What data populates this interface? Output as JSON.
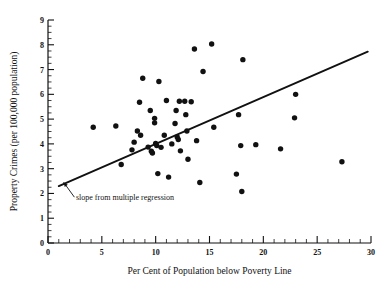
{
  "chart_data": {
    "type": "scatter",
    "title": "",
    "xlabel": "Per Cent of Population below Poverty Line",
    "ylabel": "Property Crimes (per 100,000 population)",
    "xlim": [
      0,
      30
    ],
    "ylim": [
      0,
      9
    ],
    "xticks": [
      0,
      5,
      10,
      15,
      20,
      25,
      30
    ],
    "yticks": [
      0,
      1,
      2,
      3,
      4,
      5,
      6,
      7,
      8,
      9
    ],
    "xtick_labels": [
      "0",
      "5",
      "10",
      "15",
      "20",
      "25",
      "30"
    ],
    "ytick_labels": [
      "0",
      "1",
      "2",
      "3",
      "4",
      "5",
      "6",
      "7",
      "8",
      "9"
    ],
    "x_minor_tick_step": 1,
    "y_minor_tick_step": 0.25,
    "grid": false,
    "legend": null,
    "point_color": "#111111",
    "line_color": "#111111",
    "background_color": "#ffffff",
    "points": [
      {
        "x": 4.2,
        "y": 4.67
      },
      {
        "x": 6.3,
        "y": 4.72
      },
      {
        "x": 6.8,
        "y": 3.17
      },
      {
        "x": 7.8,
        "y": 3.76
      },
      {
        "x": 8.0,
        "y": 4.07
      },
      {
        "x": 8.3,
        "y": 4.52
      },
      {
        "x": 8.5,
        "y": 5.68
      },
      {
        "x": 8.6,
        "y": 4.35
      },
      {
        "x": 8.8,
        "y": 6.65
      },
      {
        "x": 9.3,
        "y": 3.87
      },
      {
        "x": 9.5,
        "y": 5.35
      },
      {
        "x": 9.6,
        "y": 3.7
      },
      {
        "x": 9.7,
        "y": 3.63
      },
      {
        "x": 9.9,
        "y": 4.85
      },
      {
        "x": 9.9,
        "y": 5.03
      },
      {
        "x": 10.0,
        "y": 4.02
      },
      {
        "x": 10.1,
        "y": 3.93
      },
      {
        "x": 10.2,
        "y": 2.8
      },
      {
        "x": 10.3,
        "y": 6.52
      },
      {
        "x": 10.5,
        "y": 3.86
      },
      {
        "x": 10.8,
        "y": 4.35
      },
      {
        "x": 11.0,
        "y": 5.75
      },
      {
        "x": 11.2,
        "y": 2.66
      },
      {
        "x": 11.5,
        "y": 4.0
      },
      {
        "x": 11.8,
        "y": 4.82
      },
      {
        "x": 11.9,
        "y": 5.35
      },
      {
        "x": 12.0,
        "y": 4.28
      },
      {
        "x": 12.1,
        "y": 4.18
      },
      {
        "x": 12.2,
        "y": 5.72
      },
      {
        "x": 12.3,
        "y": 3.72
      },
      {
        "x": 12.7,
        "y": 5.72
      },
      {
        "x": 12.8,
        "y": 5.18
      },
      {
        "x": 12.9,
        "y": 4.52
      },
      {
        "x": 13.0,
        "y": 3.38
      },
      {
        "x": 13.3,
        "y": 5.7
      },
      {
        "x": 13.6,
        "y": 7.83
      },
      {
        "x": 13.8,
        "y": 4.13
      },
      {
        "x": 14.1,
        "y": 2.44
      },
      {
        "x": 14.4,
        "y": 6.92
      },
      {
        "x": 15.2,
        "y": 8.03
      },
      {
        "x": 15.4,
        "y": 4.67
      },
      {
        "x": 17.5,
        "y": 2.78
      },
      {
        "x": 17.7,
        "y": 5.18
      },
      {
        "x": 17.9,
        "y": 3.93
      },
      {
        "x": 18.0,
        "y": 2.08
      },
      {
        "x": 18.1,
        "y": 7.4
      },
      {
        "x": 19.3,
        "y": 3.97
      },
      {
        "x": 21.6,
        "y": 3.8
      },
      {
        "x": 22.9,
        "y": 5.05
      },
      {
        "x": 23.0,
        "y": 6.0
      },
      {
        "x": 27.3,
        "y": 3.28
      }
    ],
    "regression_line": {
      "label": "slope from multiple regression",
      "x_start": 1.0,
      "y_start": 2.3,
      "x_end": 29.7,
      "y_end": 7.72,
      "slope": 0.189,
      "intercept": 2.111
    },
    "annotation": {
      "text": "slope from multiple regression",
      "text_x": 2.6,
      "text_y": 1.72,
      "arrow_tip_x": 1.45,
      "arrow_tip_y": 2.45,
      "arrow_tail_x": 2.45,
      "arrow_tail_y": 1.85
    }
  }
}
